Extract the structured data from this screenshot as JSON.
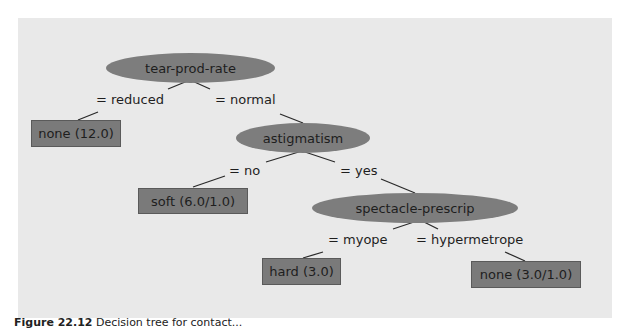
{
  "tree": {
    "root": {
      "label": "tear-prod-rate"
    },
    "nodes": [
      {
        "id": "astigmatism",
        "label": "astigmatism"
      },
      {
        "id": "spectacle",
        "label": "spectacle-prescrip"
      }
    ],
    "leaves": [
      {
        "id": "leaf-none-12",
        "label": "none (12.0)"
      },
      {
        "id": "leaf-soft",
        "label": "soft (6.0/1.0)"
      },
      {
        "id": "leaf-hard",
        "label": "hard (3.0)"
      },
      {
        "id": "leaf-none-3",
        "label": "none (3.0/1.0)"
      }
    ],
    "edges": [
      {
        "label": "= reduced"
      },
      {
        "label": "= normal"
      },
      {
        "label": "= no"
      },
      {
        "label": "= yes"
      },
      {
        "label": "= myope"
      },
      {
        "label": "= hypermetrope"
      }
    ]
  },
  "caption": {
    "prefix": "Figure 22.12",
    "text": "Decision tree for contact..."
  },
  "colors": {
    "background": "#e9e9e9",
    "node_fill": "#7d7d7d",
    "text": "#1e1e1e"
  }
}
